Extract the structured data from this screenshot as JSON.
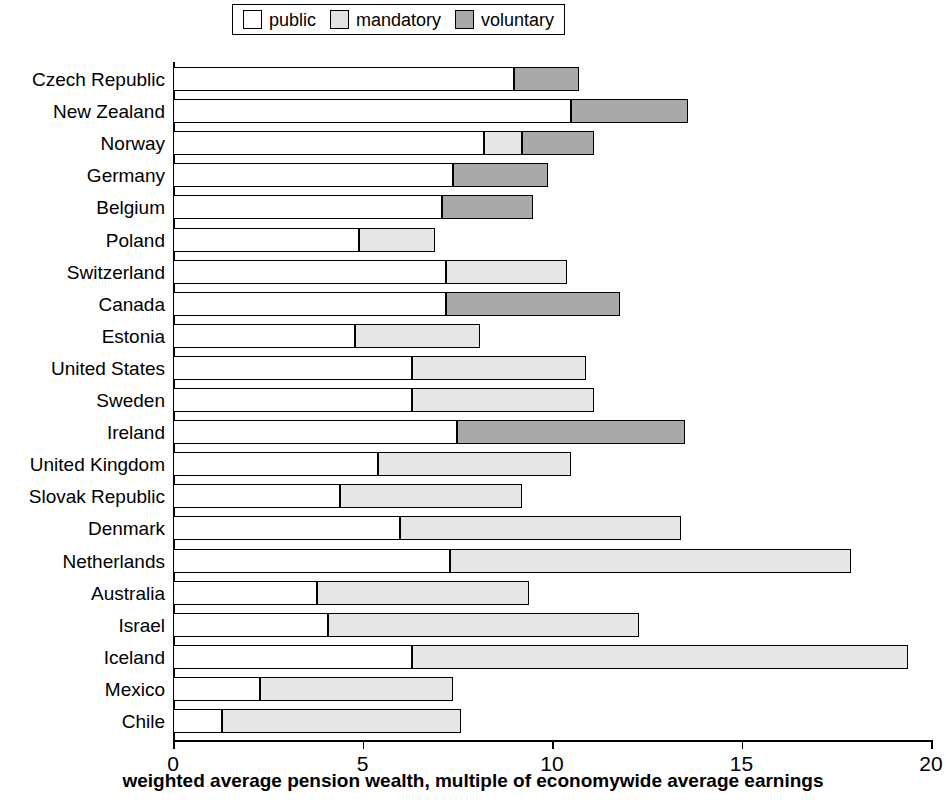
{
  "legend": {
    "items": [
      {
        "label": "public",
        "color": "#ffffff"
      },
      {
        "label": "mandatory",
        "color": "#e6e6e6"
      },
      {
        "label": "voluntary",
        "color": "#a9a9a9"
      }
    ]
  },
  "axis": {
    "x_title": "weighted average pension wealth, multiple of economywide average earnings",
    "x_ticks": [
      "0",
      "5",
      "10",
      "15",
      "20"
    ]
  },
  "chart_data": {
    "type": "bar",
    "orientation": "horizontal",
    "stacked": true,
    "title": "",
    "xlabel": "weighted average pension wealth, multiple of economywide average earnings",
    "ylabel": "",
    "xlim": [
      0,
      20
    ],
    "xticks": [
      0,
      5,
      10,
      15,
      20
    ],
    "grid": false,
    "legend_position": "top-center",
    "categories": [
      "Czech Republic",
      "New Zealand",
      "Norway",
      "Germany",
      "Belgium",
      "Poland",
      "Switzerland",
      "Canada",
      "Estonia",
      "United States",
      "Sweden",
      "Ireland",
      "United Kingdom",
      "Slovak Republic",
      "Denmark",
      "Netherlands",
      "Australia",
      "Israel",
      "Iceland",
      "Mexico",
      "Chile"
    ],
    "series": [
      {
        "name": "public",
        "color": "#ffffff",
        "values": [
          9.0,
          10.5,
          8.2,
          7.4,
          7.1,
          4.9,
          7.2,
          7.2,
          4.8,
          6.3,
          6.3,
          7.5,
          5.4,
          4.4,
          6.0,
          7.3,
          3.8,
          4.1,
          6.3,
          2.3,
          1.3
        ]
      },
      {
        "name": "mandatory",
        "color": "#e6e6e6",
        "values": [
          0.0,
          0.0,
          1.0,
          0.0,
          0.0,
          2.0,
          3.2,
          0.0,
          3.3,
          4.6,
          4.8,
          0.0,
          5.1,
          4.8,
          7.4,
          10.6,
          5.6,
          8.2,
          13.1,
          5.1,
          6.3
        ]
      },
      {
        "name": "voluntary",
        "color": "#a9a9a9",
        "values": [
          1.7,
          3.1,
          1.9,
          2.5,
          2.4,
          0.0,
          0.0,
          4.6,
          0.0,
          0.0,
          0.0,
          6.0,
          0.0,
          0.0,
          0.0,
          0.0,
          0.0,
          0.0,
          0.0,
          0.0,
          0.0
        ]
      }
    ],
    "totals": [
      10.7,
      13.6,
      11.1,
      9.9,
      9.5,
      6.9,
      10.4,
      11.8,
      8.1,
      10.9,
      11.1,
      13.5,
      10.5,
      9.2,
      13.4,
      17.9,
      9.4,
      12.3,
      19.4,
      7.4,
      7.6
    ]
  }
}
